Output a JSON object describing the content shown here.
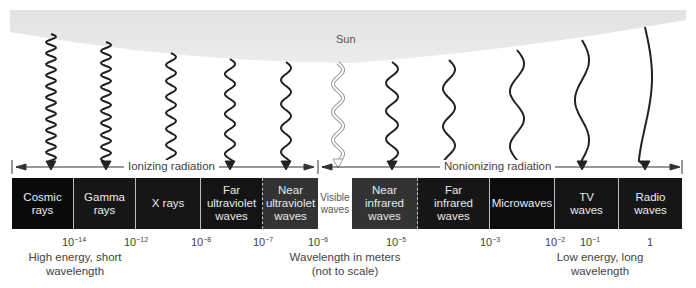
{
  "source": {
    "label": "Sun",
    "fill": "#e6e6e6"
  },
  "ranges": [
    {
      "label": "Ionizing radiation",
      "x_start": 12,
      "x_end": 318
    },
    {
      "label": "Nonionizing radiation",
      "x_start": 318,
      "x_end": 682
    }
  ],
  "segments": [
    {
      "id": "cosmic",
      "label": "Cosmic rays",
      "lines": [
        "Cosmic",
        "rays"
      ],
      "x": 12,
      "w": 62,
      "fill": "#0a0a0a",
      "divider": "solid"
    },
    {
      "id": "gamma",
      "label": "Gamma rays",
      "lines": [
        "Gamma",
        "rays"
      ],
      "x": 74,
      "w": 62,
      "fill": "#161616",
      "divider": "solid"
    },
    {
      "id": "xray",
      "label": "X rays",
      "lines": [
        "X rays"
      ],
      "x": 136,
      "w": 65,
      "fill": "#161616",
      "divider": "solid"
    },
    {
      "id": "far-uv",
      "label": "Far ultraviolet waves",
      "lines": [
        "Far",
        "ultraviolet",
        "waves"
      ],
      "x": 201,
      "w": 62,
      "fill": "#141414",
      "divider": "dashed"
    },
    {
      "id": "near-uv",
      "label": "Near ultraviolet waves",
      "lines": [
        "Near",
        "ultraviolet",
        "waves"
      ],
      "x": 263,
      "w": 55,
      "fill": "#333333",
      "divider": "none"
    },
    {
      "id": "visible",
      "label": "Visible waves",
      "lines": [
        "Visible",
        "waves"
      ],
      "x": 318,
      "w": 34,
      "fill": "#ffffff",
      "divider": "none"
    },
    {
      "id": "near-ir",
      "label": "Near infrared waves",
      "lines": [
        "Near",
        "infrared",
        "waves"
      ],
      "x": 352,
      "w": 66,
      "fill": "#333333",
      "divider": "dashed"
    },
    {
      "id": "far-ir",
      "label": "Far infrared waves",
      "lines": [
        "Far",
        "infrared",
        "waves"
      ],
      "x": 418,
      "w": 72,
      "fill": "#161616",
      "divider": "solid"
    },
    {
      "id": "microwaves",
      "label": "Microwaves",
      "lines": [
        "Microwaves"
      ],
      "x": 490,
      "w": 65,
      "fill": "#0c0c0c",
      "divider": "solid"
    },
    {
      "id": "tv",
      "label": "TV waves",
      "lines": [
        "TV",
        "waves"
      ],
      "x": 555,
      "w": 64,
      "fill": "#141414",
      "divider": "solid"
    },
    {
      "id": "radio",
      "label": "Radio waves",
      "lines": [
        "Radio",
        "waves"
      ],
      "x": 619,
      "w": 63,
      "fill": "#161616",
      "divider": "none"
    }
  ],
  "ticks": [
    {
      "base": "10",
      "exp": "−14",
      "x": 74
    },
    {
      "base": "10",
      "exp": "−12",
      "x": 136
    },
    {
      "base": "10",
      "exp": "−8",
      "x": 201
    },
    {
      "base": "10",
      "exp": "−7",
      "x": 263
    },
    {
      "base": "10",
      "exp": "−6",
      "x": 318
    },
    {
      "base": "10",
      "exp": "−5",
      "x": 396
    },
    {
      "base": "10",
      "exp": "−3",
      "x": 490
    },
    {
      "base": "10",
      "exp": "−2",
      "x": 555
    },
    {
      "base": "10",
      "exp": "−1",
      "x": 590
    },
    {
      "base": "1",
      "exp": "",
      "x": 650
    }
  ],
  "captions": {
    "left": [
      "High energy, short",
      "wavelength"
    ],
    "center": [
      "Wavelength in meters",
      "(not to scale)"
    ],
    "right": [
      "Low energy, long",
      "wavelength"
    ]
  },
  "waves": [
    {
      "x": 51,
      "y0": 34,
      "y1": 170,
      "amp": 5,
      "period": 11,
      "hollow": false
    },
    {
      "x": 106,
      "y0": 42,
      "y1": 170,
      "amp": 5,
      "period": 12,
      "hollow": false
    },
    {
      "x": 171,
      "y0": 53,
      "y1": 170,
      "amp": 5,
      "period": 16,
      "hollow": false
    },
    {
      "x": 230,
      "y0": 59,
      "y1": 170,
      "amp": 5,
      "period": 20,
      "hollow": false
    },
    {
      "x": 286,
      "y0": 62,
      "y1": 170,
      "amp": 5,
      "period": 24,
      "hollow": false
    },
    {
      "x": 338,
      "y0": 63,
      "y1": 168,
      "amp": 5,
      "period": 28,
      "hollow": true
    },
    {
      "x": 392,
      "y0": 62,
      "y1": 170,
      "amp": 6,
      "period": 28,
      "hollow": false
    },
    {
      "x": 449,
      "y0": 60,
      "y1": 170,
      "amp": 6,
      "period": 38,
      "hollow": false
    },
    {
      "x": 517,
      "y0": 50,
      "y1": 170,
      "amp": 7,
      "period": 55,
      "hollow": false
    },
    {
      "x": 582,
      "y0": 40,
      "y1": 170,
      "amp": 7,
      "period": 80,
      "hollow": false
    },
    {
      "x": 645,
      "y0": 27,
      "y1": 170,
      "amp": 7,
      "period": 200,
      "hollow": false
    }
  ]
}
